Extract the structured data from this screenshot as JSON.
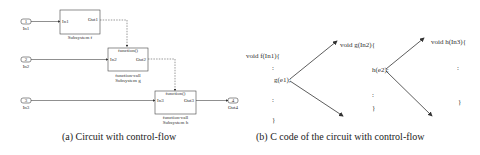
{
  "figure_a": {
    "caption": "(a) Circuit with control-flow",
    "inports": [
      {
        "num": "1",
        "label": "In1"
      },
      {
        "num": "2",
        "label": "In2"
      },
      {
        "num": "3",
        "label": "In3"
      }
    ],
    "outport": {
      "num": "4",
      "label": "Out4"
    },
    "blocks": [
      {
        "in": "In1",
        "out": "Out1",
        "trigger": "",
        "label1": "Subsystem f",
        "label2": ""
      },
      {
        "in": "In2",
        "out": "Out2",
        "trigger": "function()",
        "label1": "function-call",
        "label2": "Subsystem g"
      },
      {
        "in": "In3",
        "out": "Out3",
        "trigger": "function()",
        "label1": "function-call",
        "label2": "Subsystem h"
      }
    ]
  },
  "figure_b": {
    "caption": "(b) C code of the circuit with control-flow",
    "f_header": "void f(In1){",
    "g_call": "g(e1);",
    "g_header": "void g(In2){",
    "h_call": "h(e2);",
    "h_header": "void h(In3){",
    "ellipsis": ":",
    "close": "}"
  }
}
